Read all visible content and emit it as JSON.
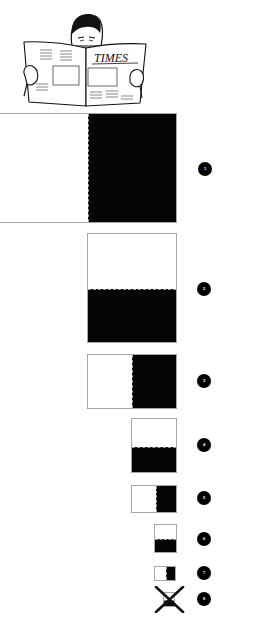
{
  "illustration": {
    "subject": "man reading newspaper",
    "newspaper_title": "TIMES"
  },
  "colors": {
    "fill": "#050505",
    "border": "#a8a8a8",
    "background": "#ffffff",
    "badge": "#000000",
    "badge_text": "#ffffff"
  },
  "panels": [
    {
      "id": 1,
      "label": "1",
      "split": "vertical",
      "black_side": "right",
      "ratio": 0.5
    },
    {
      "id": 2,
      "label": "2",
      "split": "horizontal",
      "black_side": "bottom",
      "ratio": 0.5
    },
    {
      "id": 3,
      "label": "3",
      "split": "vertical",
      "black_side": "right",
      "ratio": 0.5
    },
    {
      "id": 4,
      "label": "4",
      "split": "horizontal",
      "black_side": "bottom",
      "ratio": 0.5
    },
    {
      "id": 5,
      "label": "5",
      "split": "vertical",
      "black_side": "right",
      "ratio": 0.5
    },
    {
      "id": 6,
      "label": "6",
      "split": "horizontal",
      "black_side": "bottom",
      "ratio": 0.5
    },
    {
      "id": 7,
      "label": "7",
      "split": "vertical",
      "black_side": "right",
      "ratio": 0.5
    },
    {
      "id": 8,
      "label": "8",
      "split": "horizontal",
      "black_side": "bottom",
      "ratio": 0.5,
      "crossed_out": true
    }
  ]
}
